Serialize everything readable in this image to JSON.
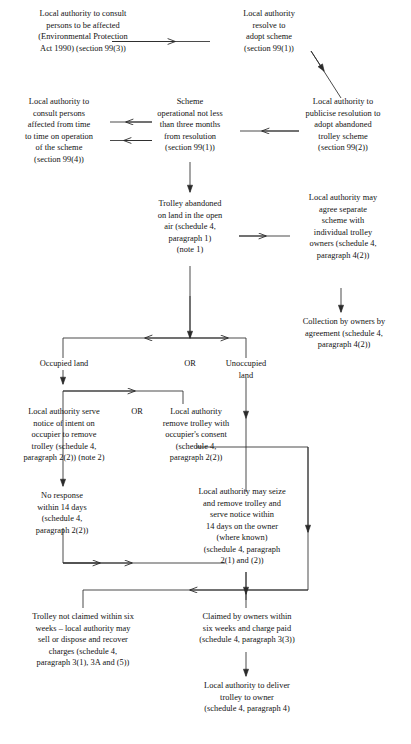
{
  "diagram": {
    "type": "flowchart",
    "stroke_color": "#2b2b2b",
    "text_color": "#121212",
    "background": "#ffffff",
    "nodes": [
      {
        "id": "consult-affected",
        "text": "Local authority to consult\npersons to be affected\n(Environmental Protection\nAct 1990) (section 99(3))"
      },
      {
        "id": "resolve-adopt",
        "text": "Local authority\nresolve to\nadopt scheme\n(section 99(1))"
      },
      {
        "id": "consult-time-to-time",
        "text": "Local authority to\nconsult persons\naffected from time\nto time on operation\nof the scheme\n(section 99(4))"
      },
      {
        "id": "scheme-operational",
        "text": "Scheme\noperational not less\nthan three months\nfrom resolution\n(section 99(1))"
      },
      {
        "id": "publicise-resolution",
        "text": "Local authority to\npublicise resolution to\nadopt abandoned\ntrolley scheme\n(section 99(2))"
      },
      {
        "id": "trolley-abandoned",
        "text": "Trolley abandoned\non land in the open\nair (schedule 4,\nparagraph 1)\n(note 1)"
      },
      {
        "id": "agree-separate-scheme",
        "text": "Local authority may\nagree separate\nscheme with\nindividual trolley\nowners (schedule 4,\nparagraph 4(2))"
      },
      {
        "id": "collection-by-owners",
        "text": "Collection by owners by\nagreement (schedule 4,\nparagraph 4(2))"
      },
      {
        "id": "occupied-land",
        "text": "Occupied land"
      },
      {
        "id": "or-split",
        "text": "OR"
      },
      {
        "id": "unoccupied-land",
        "text": "Unoccupied\nland"
      },
      {
        "id": "serve-notice-occupier",
        "text": "Local authority serve\nnotice of intent on\noccupier to remove\ntrolley (schedule 4,\nparagraph 2(2)) (note 2)"
      },
      {
        "id": "or-occupied",
        "text": "OR"
      },
      {
        "id": "remove-with-consent",
        "text": "Local authority\nremove trolley with\noccupier's consent\n(schedule 4,\nparagraph 2(2))"
      },
      {
        "id": "no-response-14-days",
        "text": "No response\nwithin 14 days\n(schedule 4,\nparagraph 2(2))"
      },
      {
        "id": "seize-and-remove",
        "text": "Local authority may seize\nand remove trolley and\nserve notice within\n14 days on the owner\n(where known)\n(schedule 4, paragraph\n2(1) and (2))"
      },
      {
        "id": "not-claimed-six-weeks",
        "text": "Trolley not claimed within six\nweeks – local authority may\nsell or dispose and recover\ncharges (schedule 4,\nparagraph 3(1), 3A and (5))"
      },
      {
        "id": "claimed-by-owners",
        "text": "Claimed by owners within\nsix weeks and charge paid\n(schedule 4, paragraph 3(3))"
      },
      {
        "id": "deliver-trolley",
        "text": "Local authority to deliver\ntrolley to owner\n(schedule 4, paragraph 4)"
      }
    ]
  }
}
